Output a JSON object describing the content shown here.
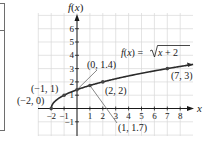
{
  "chart_data": {
    "type": "line",
    "title": "",
    "function_label": "f(x) = √(x + 2)",
    "function_label_parts": {
      "lhs": "f(x) = ",
      "radical": "x + 2"
    },
    "xlabel": "x",
    "ylabel": "f(x)",
    "xlim": [
      -3,
      9
    ],
    "ylim": [
      -2,
      7
    ],
    "grid": true,
    "x_ticks": [
      -2,
      -1,
      1,
      2,
      3,
      4,
      5,
      6,
      7,
      8
    ],
    "y_ticks": [
      -1,
      1,
      2,
      3,
      4,
      5,
      6
    ],
    "x_tick_labels": [
      "−2",
      "−1",
      "1",
      "2",
      "3",
      "4",
      "5",
      "6",
      "7",
      "8"
    ],
    "y_tick_labels": [
      "−1",
      "1",
      "2",
      "3",
      "4",
      "5",
      "6"
    ],
    "series": [
      {
        "name": "f(x) = √(x + 2)",
        "x": [
          -2,
          -1,
          0,
          1,
          2,
          7,
          9
        ],
        "y": [
          0,
          1,
          1.41,
          1.73,
          2,
          3,
          3.32
        ]
      }
    ],
    "points": [
      {
        "x": -2,
        "y": 0,
        "label": "(−2, 0)"
      },
      {
        "x": -1,
        "y": 1,
        "label": "(−1, 1)"
      },
      {
        "x": 0,
        "y": 1.4,
        "label": "(0, 1.4)"
      },
      {
        "x": 1,
        "y": 1.7,
        "label": "(1, 1.7)"
      },
      {
        "x": 2,
        "y": 2,
        "label": "(2, 2)"
      },
      {
        "x": 7,
        "y": 3,
        "label": "(7, 3)"
      }
    ]
  },
  "colors": {
    "curve": "#2b2b2b",
    "grid": "#d9d9d9",
    "axis": "#1a1a1a",
    "leader": "#555555"
  }
}
